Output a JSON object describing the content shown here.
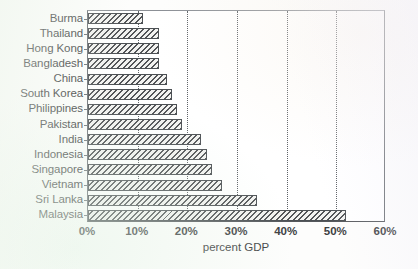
{
  "chart_data": {
    "type": "bar",
    "orientation": "horizontal",
    "title": "",
    "xlabel": "percent GDP",
    "ylabel": "",
    "xlim": [
      0,
      60
    ],
    "xticks": [
      0,
      10,
      20,
      30,
      40,
      50,
      60
    ],
    "xtick_labels": [
      "0%",
      "10%",
      "20%",
      "30%",
      "40%",
      "50%",
      "60%"
    ],
    "grid": "vertical-dotted",
    "legend": "none",
    "categories": [
      "Burma",
      "Thailand",
      "Hong Kong",
      "Bangladesh",
      "China",
      "South Korea",
      "Philippines",
      "Pakistan",
      "India",
      "Indonesia",
      "Singapore",
      "Vietnam",
      "Sri Lanka",
      "Malaysia"
    ],
    "values": [
      11,
      14.3,
      14.3,
      14.3,
      16,
      17,
      18,
      19,
      22.7,
      24,
      25,
      27,
      34,
      52
    ],
    "units": "percent of GDP"
  },
  "style": {
    "bar_edge_color": "#4c5054",
    "bar_fill_color": "#f2f2f0",
    "hatch": "diagonal",
    "axis_color": "#6b6f74",
    "grid_color": "#5d6166",
    "text_color": "#3d3f42"
  }
}
